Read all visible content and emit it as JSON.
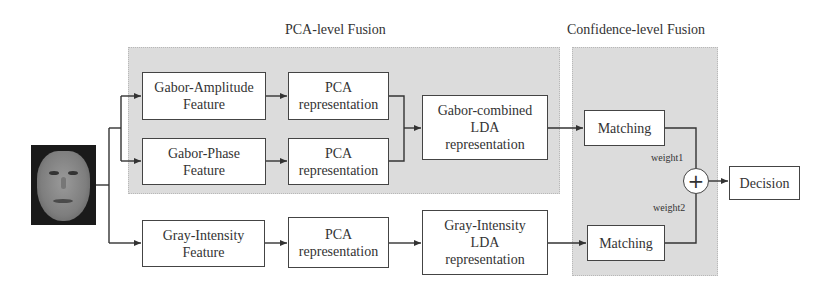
{
  "regions": {
    "pca_fusion": {
      "title": "PCA-level Fusion"
    },
    "confidence_fusion": {
      "title": "Confidence-level Fusion"
    }
  },
  "input": {
    "icon": "face-image-icon"
  },
  "boxes": {
    "gabor_amplitude": {
      "line1": "Gabor-Amplitude",
      "line2": "Feature"
    },
    "pca1": {
      "line1": "PCA",
      "line2": "representation"
    },
    "gabor_phase": {
      "line1": "Gabor-Phase",
      "line2": "Feature"
    },
    "pca2": {
      "line1": "PCA",
      "line2": "representation"
    },
    "gabor_combined_lda": {
      "line1": "Gabor-combined",
      "line2": "LDA",
      "line3": "representation"
    },
    "matching1": {
      "line1": "Matching"
    },
    "gray_intensity": {
      "line1": "Gray-Intensity",
      "line2": "Feature"
    },
    "pca3": {
      "line1": "PCA",
      "line2": "representation"
    },
    "gray_intensity_lda": {
      "line1": "Gray-Intensity",
      "line2": "LDA",
      "line3": "representation"
    },
    "matching2": {
      "line1": "Matching"
    },
    "decision": {
      "line1": "Decision"
    }
  },
  "fusion": {
    "symbol": "+",
    "weight1": "weight1",
    "weight2": "weight2"
  },
  "colors": {
    "region_fill": "#dcdcdc",
    "box_border": "#444444",
    "line": "#333333"
  }
}
